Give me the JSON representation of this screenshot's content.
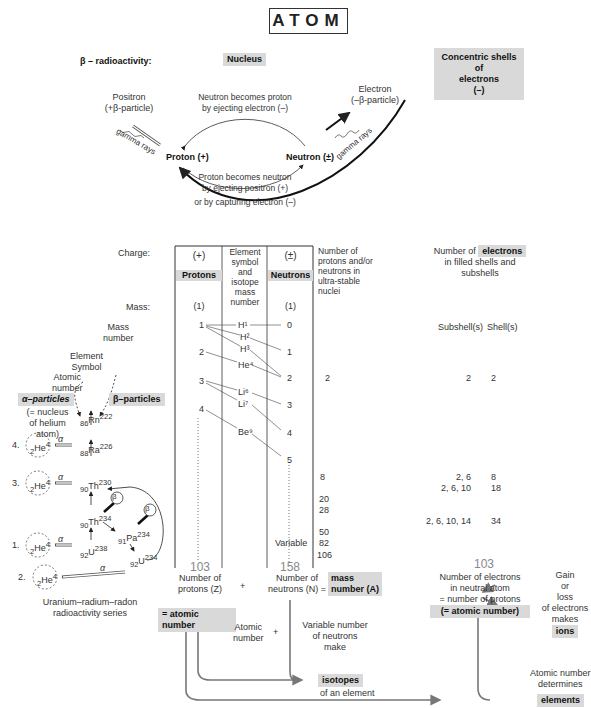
{
  "title": "ATOM",
  "beta": {
    "label": "β – radioactivity:",
    "nucleus": "Nucleus",
    "shells_box": [
      "Concentric shells",
      "of",
      "electrons",
      "(–)"
    ],
    "positron": [
      "Positron",
      "(+β-particle)"
    ],
    "electron": [
      "Electron",
      "(–β-particle)"
    ],
    "gamma": "gamma rays",
    "proton": "Proton (+)",
    "neutron": "Neutron (±)",
    "arc_top": [
      "Neutron becomes proton",
      "by ejecting electron (–)"
    ],
    "arc_bottom": [
      "Proton becomes neutron",
      "by ejecting positron (+)",
      "or by capturing electron (–)"
    ]
  },
  "table": {
    "charge_label": "Charge:",
    "mass_label": "Mass:",
    "protons": {
      "charge": "(+)",
      "label": "Protons",
      "mass": "(1)",
      "values": [
        "1",
        "2",
        "3",
        "4"
      ],
      "max": "103"
    },
    "elements": {
      "header": [
        "Element",
        "symbol",
        "and",
        "isotope",
        "mass",
        "number"
      ],
      "values": [
        "H¹",
        "H²",
        "H³",
        "He⁴",
        "Li⁶",
        "Li⁷",
        "Be⁹"
      ]
    },
    "neutrons": {
      "charge": "(±)",
      "label": "Neutrons",
      "mass": "(1)",
      "values": [
        "0",
        "1",
        "2",
        "3",
        "4",
        "5"
      ],
      "variable": "Variable",
      "max": "158"
    },
    "stable": {
      "header": [
        "Number of",
        "protons and/or",
        "neutrons in",
        "ultra-stable",
        "nuclei"
      ],
      "values": [
        "2",
        "8",
        "20",
        "28",
        "50",
        "82",
        "106"
      ]
    }
  },
  "electrons": {
    "header": [
      "Number of",
      "electrons",
      "in filled shells and",
      "subshells"
    ],
    "col_subshell": "Subshell(s)",
    "col_shell": "Shell(s)",
    "rows": [
      {
        "subshell": "2",
        "shell": "2"
      },
      {
        "subshell": "2, 6",
        "shell": "8"
      },
      {
        "subshell": "2, 6, 10",
        "shell": "18"
      },
      {
        "subshell": "2, 6, 10, 14",
        "shell": "34"
      }
    ],
    "max": "103",
    "neutral": [
      "Number of electrons",
      "in neutral atom",
      "= number of protons",
      "(= atomic number)"
    ],
    "ions": [
      "Gain",
      "or",
      "loss",
      "of electrons",
      "makes",
      "ions"
    ]
  },
  "series": {
    "legend_mass": [
      "Mass",
      "number"
    ],
    "legend_symbol": [
      "Element",
      "Symbol"
    ],
    "legend_atomic": [
      "Atomic",
      "number"
    ],
    "alpha": "α–particles",
    "alpha_note": [
      "(= nucleus",
      "of helium",
      "atom)"
    ],
    "beta": "β–particles",
    "beta_symbol": "β",
    "alpha_symbol": "α",
    "nuclides": {
      "rn": "Rn",
      "rn_z": "86",
      "rn_a": "222",
      "ra": "Ra",
      "ra_z": "88",
      "ra_a": "226",
      "th230": "Th",
      "th230_z": "90",
      "th230_a": "230",
      "th234": "Th",
      "th234_z": "90",
      "th234_a": "234",
      "pa": "Pa",
      "pa_z": "91",
      "pa_a": "234",
      "u234": "U",
      "u234_z": "92",
      "u234_a": "234",
      "u238": "U",
      "u238_z": "92",
      "u238_a": "238"
    },
    "helium": [
      "4.",
      "3.",
      "1.",
      "2."
    ],
    "he": "He",
    "caption": [
      "Uranium–radium–radon",
      "radioactivity series"
    ]
  },
  "bottom": {
    "protons_count": [
      "Number of",
      "protons (Z)"
    ],
    "plus": "+",
    "neutrons_count": [
      "Number of",
      "neutrons (N) ="
    ],
    "mass_number": [
      "mass",
      "number (A)"
    ],
    "atomic_number": "= atomic number",
    "atomic_small": [
      "Atomic",
      "number"
    ],
    "variable": [
      "Variable number",
      "of neutrons",
      "make"
    ],
    "isotopes": "isotopes",
    "of_element": "of an element",
    "determines": [
      "Atomic number",
      "determines"
    ],
    "elements": "elements"
  }
}
